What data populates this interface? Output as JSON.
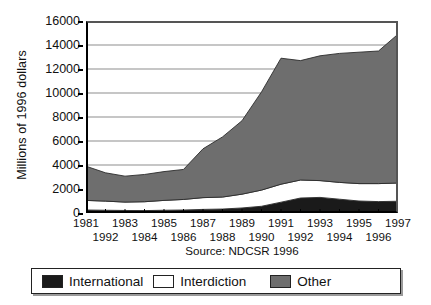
{
  "chart_data": {
    "type": "area",
    "title": "",
    "subtitle": "",
    "xlabel": "",
    "ylabel": "Millions of 1996 dollars",
    "source": "Source: NDCSR 1996",
    "stacked": true,
    "grid": true,
    "legend_position": "bottom",
    "ylim": [
      0,
      16000
    ],
    "ytick_labels": [
      "16000",
      "14000",
      "12000",
      "10000",
      "8000",
      "6000",
      "4000",
      "2000",
      "0"
    ],
    "ytick_values": [
      16000,
      14000,
      12000,
      10000,
      8000,
      6000,
      4000,
      2000,
      0
    ],
    "x": [
      1981,
      1982,
      1983,
      1984,
      1985,
      1986,
      1987,
      1988,
      1989,
      1990,
      1991,
      1992,
      1993,
      1994,
      1995,
      1996,
      1997
    ],
    "xtick_labels_row1": [
      "1981",
      "1983",
      "1985",
      "1987",
      "1989",
      "1991",
      "1993",
      "1995",
      "1997"
    ],
    "xtick_values_row1": [
      1981,
      1983,
      1985,
      1987,
      1989,
      1991,
      1993,
      1995,
      1997
    ],
    "xtick_labels_row2": [
      "1992",
      "1984",
      "1986",
      "1988",
      "1990",
      "1992",
      "1994",
      "1996"
    ],
    "xtick_values_row2": [
      1982,
      1984,
      1986,
      1988,
      1990,
      1992,
      1994,
      1996
    ],
    "series": [
      {
        "name": "International",
        "color": "#1a1a1a",
        "values": [
          250,
          230,
          210,
          200,
          230,
          250,
          300,
          330,
          420,
          560,
          900,
          1250,
          1300,
          1150,
          1000,
          950,
          980
        ]
      },
      {
        "name": "Interdiction",
        "color": "#ffffff",
        "values": [
          800,
          760,
          700,
          740,
          820,
          880,
          980,
          1000,
          1150,
          1350,
          1500,
          1500,
          1400,
          1400,
          1450,
          1500,
          1520
        ]
      },
      {
        "name": "Other",
        "color": "#6e6e6e",
        "values": [
          2850,
          2360,
          2160,
          2270,
          2400,
          2500,
          4070,
          5010,
          6120,
          8180,
          10500,
          9950,
          10400,
          10750,
          10950,
          11050,
          12400
        ]
      }
    ],
    "totals": [
      3900,
      3350,
      3070,
      3210,
      3450,
      3630,
      5350,
      6340,
      7690,
      10090,
      12900,
      12700,
      13100,
      13300,
      13400,
      13500,
      14900
    ]
  },
  "legend": {
    "items": [
      {
        "label": "International",
        "color": "#1a1a1a"
      },
      {
        "label": "Interdiction",
        "color": "#ffffff"
      },
      {
        "label": "Other",
        "color": "#6e6e6e"
      }
    ]
  }
}
